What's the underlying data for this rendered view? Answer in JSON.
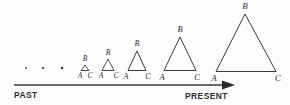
{
  "figure": {
    "type": "diagram",
    "background_color": "#fefefe",
    "ink_color": "#3a3a3a",
    "baseline_y": 71
  },
  "axis": {
    "left_label": "PAST",
    "right_label": "PRESENT",
    "line": {
      "x1": 14,
      "y1": 85,
      "x2": 222,
      "y2": 85,
      "stroke_width": 1.6
    },
    "arrow_head": {
      "x": 222,
      "y": 85,
      "length": 13,
      "half_height": 4.5
    },
    "left_label_pos": {
      "x": 14,
      "y": 96
    },
    "right_label_pos": {
      "x": 185,
      "y": 97
    },
    "label_font_size": 8.5
  },
  "stages": [
    {
      "name": "stage-1-dot",
      "shape": "dot",
      "cx": 26,
      "cy": 68,
      "r": 0.9,
      "labels": []
    },
    {
      "name": "stage-2-dot",
      "shape": "dot",
      "cx": 43,
      "cy": 68,
      "r": 1.1,
      "labels": []
    },
    {
      "name": "stage-3-dot",
      "shape": "dot",
      "cx": 62,
      "cy": 68,
      "r": 1.3,
      "labels": []
    },
    {
      "name": "stage-4-triangle",
      "shape": "triangle",
      "apex": {
        "x": 85,
        "y": 65
      },
      "left": {
        "x": 81,
        "y": 70.5
      },
      "right": {
        "x": 89,
        "y": 70.5
      },
      "stroke_width": 0.9,
      "labels": [
        {
          "text": "B",
          "x": 85,
          "y": 59,
          "size": 7.5
        },
        {
          "text": "A",
          "x": 80,
          "y": 76,
          "size": 7.5
        },
        {
          "text": "C",
          "x": 90,
          "y": 76,
          "size": 7.5
        }
      ]
    },
    {
      "name": "stage-5-triangle",
      "shape": "triangle",
      "apex": {
        "x": 108,
        "y": 59
      },
      "left": {
        "x": 102,
        "y": 70.5
      },
      "right": {
        "x": 114,
        "y": 70.5
      },
      "stroke_width": 0.9,
      "labels": [
        {
          "text": "B",
          "x": 108,
          "y": 53,
          "size": 7.5
        },
        {
          "text": "A",
          "x": 101,
          "y": 76,
          "size": 7.5
        },
        {
          "text": "C",
          "x": 116,
          "y": 76,
          "size": 7.5
        }
      ]
    },
    {
      "name": "stage-6-triangle",
      "shape": "triangle",
      "apex": {
        "x": 137,
        "y": 51
      },
      "left": {
        "x": 128,
        "y": 70.5
      },
      "right": {
        "x": 146,
        "y": 70.5
      },
      "stroke_width": 1,
      "labels": [
        {
          "text": "B",
          "x": 137,
          "y": 44,
          "size": 8
        },
        {
          "text": "A",
          "x": 126,
          "y": 77,
          "size": 8
        },
        {
          "text": "C",
          "x": 148,
          "y": 77,
          "size": 8
        }
      ]
    },
    {
      "name": "stage-7-triangle",
      "shape": "triangle",
      "apex": {
        "x": 180,
        "y": 37
      },
      "left": {
        "x": 164,
        "y": 70.5
      },
      "right": {
        "x": 196,
        "y": 70.5
      },
      "stroke_width": 1,
      "labels": [
        {
          "text": "B",
          "x": 180,
          "y": 30,
          "size": 8.5
        },
        {
          "text": "A",
          "x": 162,
          "y": 78,
          "size": 8.5
        },
        {
          "text": "C",
          "x": 197,
          "y": 78,
          "size": 8.5
        }
      ]
    },
    {
      "name": "stage-8-triangle",
      "shape": "triangle",
      "apex": {
        "x": 245,
        "y": 14
      },
      "left": {
        "x": 216,
        "y": 71.5
      },
      "right": {
        "x": 276,
        "y": 71.5
      },
      "stroke_width": 1,
      "labels": [
        {
          "text": "B",
          "x": 245,
          "y": 7,
          "size": 9
        },
        {
          "text": "A",
          "x": 214,
          "y": 79,
          "size": 9
        },
        {
          "text": "C",
          "x": 278,
          "y": 79,
          "size": 9
        }
      ]
    }
  ]
}
